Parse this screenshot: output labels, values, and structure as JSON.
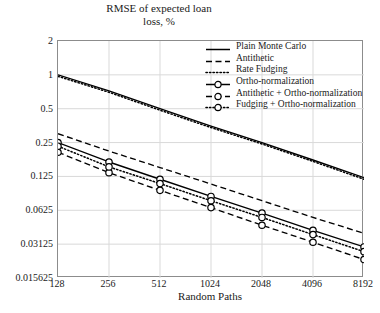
{
  "chart_data": {
    "type": "line",
    "title": "",
    "ylabel": "RMSE of expected loan loss, %",
    "xlabel": "Random Paths",
    "xscale": "log2",
    "yscale": "log2",
    "grid": true,
    "legend_position": "top-right",
    "x": [
      128,
      256,
      512,
      1024,
      2048,
      4096,
      8192
    ],
    "xticklabels": [
      "128",
      "256",
      "512",
      "1024",
      "2048",
      "4096",
      "8192"
    ],
    "yticks": [
      2,
      1,
      0.5,
      0.25,
      0.125,
      0.0625,
      0.03125,
      0.015625
    ],
    "yticklabels": [
      "2",
      "1",
      "0.5",
      "0.25",
      "0.125",
      "0.0625",
      "0.03125",
      "0.015625"
    ],
    "ylim": [
      0.015625,
      2
    ],
    "xlim": [
      128,
      8192
    ],
    "series": [
      {
        "name": "Plain Monte Carlo",
        "style": "solid",
        "marker": "none",
        "color": "#000000",
        "values": [
          1.0,
          0.72,
          0.5,
          0.35,
          0.25,
          0.175,
          0.122
        ]
      },
      {
        "name": "Antithetic",
        "style": "dashed",
        "marker": "none",
        "color": "#000000",
        "values": [
          0.3,
          0.21,
          0.15,
          0.107,
          0.076,
          0.054,
          0.039
        ]
      },
      {
        "name": "Rate Fudging",
        "style": "dotted",
        "marker": "none",
        "color": "#000000",
        "values": [
          0.97,
          0.7,
          0.485,
          0.34,
          0.243,
          0.17,
          0.118
        ]
      },
      {
        "name": "Ortho-normalization",
        "style": "solid",
        "marker": "circle",
        "color": "#000000",
        "values": [
          0.25,
          0.168,
          0.118,
          0.083,
          0.059,
          0.0415,
          0.0295
        ]
      },
      {
        "name": "Antithetic + Ortho-normalization",
        "style": "dashed",
        "marker": "circle",
        "color": "#000000",
        "values": [
          0.205,
          0.135,
          0.094,
          0.066,
          0.046,
          0.0325,
          0.0228
        ]
      },
      {
        "name": "Fudging + Ortho-normalization",
        "style": "dotted",
        "marker": "circle",
        "color": "#000000",
        "values": [
          0.232,
          0.152,
          0.108,
          0.076,
          0.054,
          0.038,
          0.0268
        ]
      }
    ]
  },
  "legend": {
    "items": [
      {
        "label": "Plain Monte Carlo"
      },
      {
        "label": "Antithetic"
      },
      {
        "label": "Rate Fudging"
      },
      {
        "label": "Ortho-normalization"
      },
      {
        "label": "Antithetic + Ortho-normalization"
      },
      {
        "label": "Fudging + Ortho-normalization"
      }
    ]
  },
  "axes": {
    "y_title_line1": "RMSE of expected loan",
    "y_title_line2": "loss, %",
    "x_title": "Random Paths"
  },
  "style": {
    "grid_color": "#d9d9d9",
    "frame_color": "#8c8c8c",
    "line_color": "#000000",
    "background": "#ffffff"
  }
}
